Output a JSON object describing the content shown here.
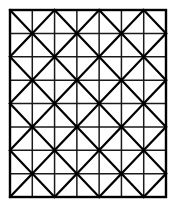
{
  "figure": {
    "canvas": {
      "width": 175,
      "height": 208,
      "background_color": "#ffffff"
    },
    "frame": {
      "x": 10,
      "y": 10,
      "width": 156,
      "height": 187,
      "stroke_color": "#000000",
      "stroke_width": 2.4
    },
    "grid": {
      "columns": 7,
      "rows": 8,
      "cell_width": 22.2857,
      "cell_height": 23.375,
      "line_color": "#1a1a1a",
      "line_width": 1.5
    },
    "diagonals": {
      "pattern": "checkerboard-star",
      "description": "At each interior lattice node where (column + row) is even, the four diagonals of the four adjacent cells converge, forming an eight-armed star.",
      "line_color": "#000000",
      "line_width": 2.2,
      "parity": 0
    }
  },
  "chart_data": {
    "type": "diagram",
    "geometry": "square-lattice-with-alternating-diagonals",
    "columns": 7,
    "rows": 8,
    "total_cells": 56,
    "star_nodes": 12,
    "xlim": [
      0,
      7
    ],
    "ylim": [
      0,
      8
    ],
    "grid": true,
    "legend": null,
    "colors": {
      "background": "#ffffff",
      "grid_line": "#1a1a1a",
      "diagonal_line": "#000000",
      "frame": "#000000"
    }
  }
}
